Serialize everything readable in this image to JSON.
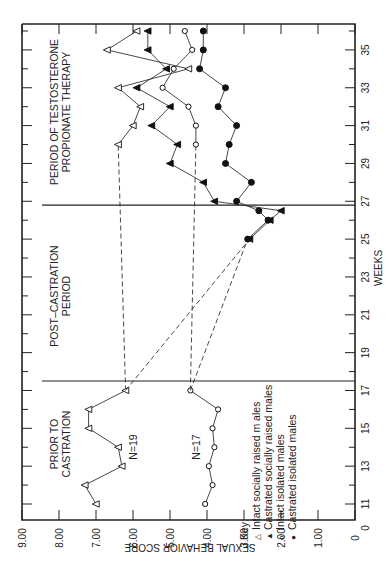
{
  "chart_data": {
    "type": "line",
    "orientation": "rotated 90 degrees counter-clockwise (weeks run bottom-to-top on right edge, score runs right-to-left on bottom edge)",
    "title": "",
    "xlabel": "WEEKS",
    "ylabel": "SEXUAL BEHAVIOR SCORE",
    "xlim": [
      10.5,
      36.5
    ],
    "ylim": [
      0,
      9
    ],
    "x_ticks_labeled": [
      "0",
      "11",
      "13",
      "15",
      "17",
      "19",
      "21",
      "23",
      "25",
      "27",
      "29",
      "31",
      "33",
      "35"
    ],
    "y_ticks_labeled": [
      "0",
      "1.00",
      "2.00",
      "3.00",
      "4.00",
      "5.00",
      "6.00",
      "7.00",
      "8.00",
      "9.00"
    ],
    "grid": false,
    "period_dividers": [
      17.5,
      26.8
    ],
    "period_labels": [
      {
        "text": "PRIOR TO CASTRATION",
        "week": 14
      },
      {
        "text": "POST–CASTRATION PERIOD",
        "week": 22
      },
      {
        "text": "PERIOD OF TESTOSTERONE PROPIONATE THERAPY",
        "week": 31
      }
    ],
    "annotations": [
      {
        "text": "N=19",
        "week": 14,
        "score": 5.7
      },
      {
        "text": "N=17",
        "week": 14,
        "score": 4.4
      }
    ],
    "legend": {
      "title": "Key:",
      "position": "lower right (in rotated frame)",
      "entries": [
        {
          "marker": "△",
          "label": "Intact socially raised males"
        },
        {
          "marker": "▲",
          "label": "Castrated socially raised males"
        },
        {
          "marker": "o",
          "label": "Intact isolated males"
        },
        {
          "marker": "●",
          "label": "Castrated isolated males"
        }
      ]
    },
    "series": [
      {
        "name": "Intact socially raised males",
        "marker": "open-triangle",
        "x": [
          11,
          12,
          13,
          14,
          15,
          16,
          17,
          30,
          31,
          32,
          33,
          34,
          35,
          36
        ],
        "values": [
          7.0,
          7.3,
          6.3,
          6.4,
          7.2,
          7.2,
          6.2,
          6.4,
          6.0,
          5.8,
          6.4,
          4.5,
          6.7,
          5.9
        ],
        "dashed_segments": [
          [
            17,
            30
          ]
        ]
      },
      {
        "name": "Intact isolated males",
        "marker": "open-circle",
        "x": [
          11,
          12,
          13,
          14,
          15,
          16,
          17,
          30,
          31,
          32,
          33,
          34,
          35,
          36
        ],
        "values": [
          4.05,
          3.85,
          3.95,
          3.8,
          3.85,
          3.7,
          4.45,
          4.3,
          4.3,
          4.5,
          5.2,
          4.9,
          4.4,
          4.6
        ],
        "dashed_segments": [
          [
            17,
            30
          ]
        ]
      },
      {
        "name": "Castrated socially raised males",
        "marker": "filled-triangle",
        "x": [
          25,
          26,
          26.5,
          27,
          28,
          29,
          30,
          31,
          32,
          33,
          34,
          35,
          36
        ],
        "values": [
          2.85,
          2.3,
          2.0,
          3.8,
          4.1,
          5.0,
          4.8,
          5.5,
          5.0,
          5.9,
          5.1,
          5.6,
          5.6
        ],
        "dashed_from": {
          "week": 17,
          "score": 6.2
        }
      },
      {
        "name": "Castrated isolated males",
        "marker": "filled-circle",
        "x": [
          25,
          26,
          26.5,
          27,
          28,
          29,
          30,
          31,
          32,
          33,
          34,
          35,
          36
        ],
        "values": [
          2.9,
          2.35,
          2.6,
          3.2,
          2.8,
          3.5,
          3.4,
          3.2,
          3.7,
          3.5,
          4.2,
          4.1,
          4.1
        ],
        "dashed_from": {
          "week": 17,
          "score": 4.45
        }
      }
    ]
  },
  "axes": {
    "score_label": "SEXUAL BEHAVIOR SCORE",
    "weeks_label": "WEEKS",
    "score_ticks": [
      "9.00",
      "8.00",
      "7.00",
      "6.00",
      "5.00",
      "4.00",
      "3.00",
      "2.00",
      "1.00",
      "0"
    ],
    "week_ticks": [
      "11",
      "13",
      "15",
      "17",
      "19",
      "21",
      "23",
      "25",
      "27",
      "29",
      "31",
      "33",
      "35"
    ],
    "week_origin": "0"
  },
  "periods": {
    "prior_line1": "PRIOR TO",
    "prior_line2": "CASTRATION",
    "post_line1": "POST–CASTRATION",
    "post_line2": "PERIOD",
    "therapy_line1": "PERIOD OF TESTOSTERONE",
    "therapy_line2": "PROPIONATE THERAPY"
  },
  "annotations": {
    "n19": "N=19",
    "n17": "N=17"
  },
  "legend": {
    "title": "Key:",
    "items": [
      {
        "symbol": "△",
        "label": "Intact socially raised m ales"
      },
      {
        "symbol": "▲",
        "label": "Castrated socially raised males"
      },
      {
        "symbol": "o",
        "label": "Intact isolated males"
      },
      {
        "symbol": "●",
        "label": "Castrated isolated males"
      }
    ]
  }
}
